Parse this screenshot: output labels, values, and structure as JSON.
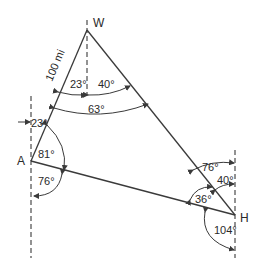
{
  "diagram": {
    "type": "navigation triangle / bearing diagram",
    "points": {
      "W": {
        "label": "W"
      },
      "A": {
        "label": "A"
      },
      "H": {
        "label": "H"
      }
    },
    "distance_label": "100 mi",
    "angles": {
      "w_left": "23°",
      "w_right": "40°",
      "w_total": "63°",
      "a_bearing": "23°",
      "a_upper": "81°",
      "a_lower": "76°",
      "h_upper": "76°",
      "h_mid": "40°",
      "h_interior": "36°",
      "h_lower": "104°"
    },
    "colors": {
      "stroke": "#3a3a3a",
      "text": "#2a2a2a",
      "background": "#ffffff"
    }
  }
}
